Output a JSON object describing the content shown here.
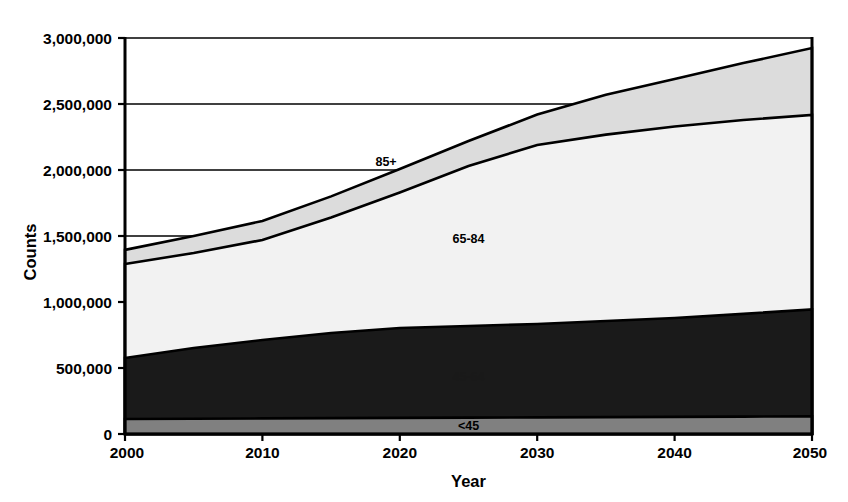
{
  "chart_data": {
    "type": "area",
    "stacked": true,
    "title": "",
    "xlabel": "Year",
    "ylabel": "Counts",
    "x": [
      2000,
      2005,
      2010,
      2015,
      2020,
      2025,
      2030,
      2035,
      2040,
      2045,
      2050
    ],
    "xlim": [
      2000,
      2050
    ],
    "ylim": [
      0,
      3000000
    ],
    "xticks": [
      "2000",
      "2010",
      "2020",
      "2030",
      "2040",
      "2050"
    ],
    "xtick_values": [
      2000,
      2010,
      2020,
      2030,
      2040,
      2050
    ],
    "yticks": [
      "0",
      "500,000",
      "1,000,000",
      "1,500,000",
      "2,000,000",
      "2,500,000",
      "3,000,000"
    ],
    "ytick_values": [
      0,
      500000,
      1000000,
      1500000,
      2000000,
      2500000,
      3000000
    ],
    "grid": "horizontal",
    "legend": "inline-labels",
    "series": [
      {
        "name": "<45",
        "label": "<45",
        "color": "#808080",
        "label_x": 2025,
        "label_y": 60000,
        "values": [
          114000,
          116000,
          118000,
          120000,
          122000,
          124000,
          126000,
          128000,
          130000,
          132000,
          134000
        ]
      },
      {
        "name": "45-64",
        "label": "45-64",
        "color": "#1a1a1a",
        "label_x": 2025,
        "label_y": 430000,
        "values": [
          576000,
          652000,
          712000,
          765000,
          803000,
          818000,
          833000,
          856000,
          879000,
          910000,
          944000
        ]
      },
      {
        "name": "65-84",
        "label": "65-84",
        "color": "#f2f2f2",
        "label_x": 2025,
        "label_y": 1480000,
        "values": [
          1288000,
          1371000,
          1470000,
          1640000,
          1830000,
          2030000,
          2190000,
          2268000,
          2330000,
          2379000,
          2417000
        ]
      },
      {
        "name": "85+",
        "label": "85+",
        "color": "#dcdcdc",
        "label_x": 2019,
        "label_y": 2060000,
        "values": [
          1395000,
          1500000,
          1614000,
          1800000,
          2008000,
          2220000,
          2420000,
          2570000,
          2690000,
          2810000,
          2924000
        ]
      }
    ]
  }
}
